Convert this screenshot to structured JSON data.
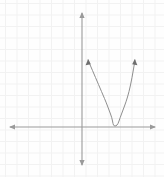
{
  "figure": {
    "background_color": "#fefefe",
    "grid_color": "#f2f2f2",
    "axis_color": "#9a9a9a",
    "curve_color": "#8e8e8e",
    "arrow_color": "#6e6e6e",
    "width_px": 164,
    "height_px": 177
  },
  "chart_data": {
    "type": "line",
    "title": "",
    "subtitle": "",
    "xlabel": "",
    "ylabel": "",
    "grid": true,
    "grid_spacing_units": 1,
    "legend": [],
    "legend_position": "none",
    "annotations": [],
    "axes": {
      "x_axis": {
        "visible": true,
        "pixel_y": 127,
        "pixel_x_start": 10,
        "pixel_x_end": 155,
        "arrows": [
          "left",
          "right"
        ],
        "tick_labels": [],
        "xlim": [
          -6.3,
          6.3
        ]
      },
      "y_axis": {
        "visible": true,
        "pixel_x": 82,
        "pixel_y_start": 13,
        "pixel_y_end": 165,
        "arrows": [
          "up",
          "down"
        ],
        "tick_labels": [],
        "ylim": [
          -3.3,
          9.9
        ]
      },
      "origin_pixel": [
        82,
        127
      ]
    },
    "series": [
      {
        "name": "parabola",
        "equation": "y = 0.5 (x - 2.6)^2",
        "vertex": [
          2.6,
          0
        ],
        "opens": "up",
        "endpoint_arrows": [
          "left-up",
          "right-up"
        ],
        "x": [
          0.5,
          0.8,
          1.1,
          1.4,
          1.7,
          2.0,
          2.3,
          2.6,
          2.9,
          3.2,
          3.5,
          3.8,
          4.1,
          4.4,
          4.7
        ],
        "y": [
          2.21,
          1.62,
          1.13,
          0.72,
          0.41,
          0.18,
          0.05,
          0.0,
          0.05,
          0.18,
          0.41,
          0.72,
          1.13,
          1.62,
          2.21
        ],
        "pixel_points": [
          [
            88,
            60
          ],
          [
            91,
            67
          ],
          [
            94,
            74
          ],
          [
            97,
            81
          ],
          [
            100,
            88
          ],
          [
            103,
            95
          ],
          [
            106,
            102
          ],
          [
            109,
            110
          ],
          [
            112,
            118
          ],
          [
            113,
            124
          ],
          [
            114,
            126
          ],
          [
            116,
            126
          ],
          [
            118,
            124
          ],
          [
            120,
            118
          ],
          [
            123,
            110
          ],
          [
            126,
            102
          ],
          [
            129,
            92
          ],
          [
            132,
            78
          ],
          [
            135,
            60
          ]
        ]
      }
    ]
  }
}
